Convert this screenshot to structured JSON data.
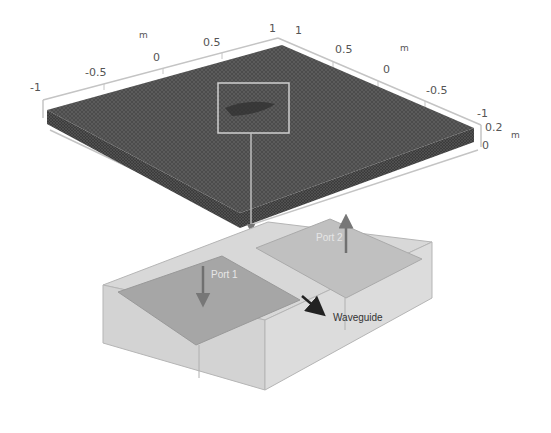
{
  "figure": {
    "colors": {
      "mesh_top": "#4a4a4a",
      "mesh_side": "#3a3a3a",
      "axis_line": "#c8c8c8",
      "box_outer": "#d6d6d6",
      "box_inner": "#a9a9a9",
      "port_arrow": "#6a6a6a",
      "waveguide_arrow": "#222222"
    }
  },
  "axes": {
    "left_axis": {
      "ticks": [
        "-1",
        "-0.5",
        "0",
        "0.5",
        "1"
      ],
      "unit": "m"
    },
    "right_axis": {
      "ticks": [
        "1",
        "0.5",
        "0",
        "-0.5",
        "-1"
      ],
      "unit": "m"
    },
    "vertical_axis": {
      "ticks": [
        "0.2",
        "0"
      ],
      "unit": "m"
    }
  },
  "labels": {
    "port1": "Port 1",
    "port2": "Port 2",
    "waveguide": "Waveguide"
  }
}
